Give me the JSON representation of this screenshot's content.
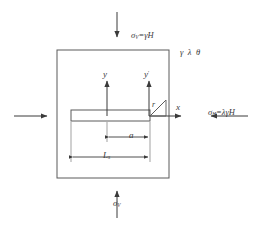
{
  "figure": {
    "type": "engineering-diagram",
    "background_color": "#ffffff",
    "line_color": "#3a3a3a",
    "text_color": "#3a3a3a"
  },
  "labels": {
    "sigma_v_top": "σ",
    "sigma_v_top_sub": "V",
    "sigma_v_top_rest": "=γH",
    "sigma_h_right": "σ",
    "sigma_h_right_sub": "H",
    "sigma_h_right_rest": "=λγH",
    "sigma_v_bottom": "σ",
    "sigma_v_bottom_sub": "V",
    "material_params": "γ λ θ",
    "axis_y": "y",
    "axis_y_prime": "y",
    "axis_y_prime_mark": "′",
    "axis_x": "x",
    "radius_r": "r",
    "crack_length_a": "a",
    "slot_length_L": "L",
    "slot_length_sub": "s"
  },
  "geometry": {
    "body_rect": {
      "x": 57,
      "y": 50,
      "w": 112,
      "h": 128
    },
    "crack_slot": {
      "x": 71,
      "y": 110,
      "w": 79,
      "h": 11
    },
    "y_axis": {
      "x": 107,
      "y_top": 79,
      "y_bottom": 116
    },
    "y_prime_axis": {
      "x": 149,
      "y_top": 79,
      "y_bottom": 116
    },
    "x_axis": {
      "y": 116,
      "x_start": 149,
      "x_end": 182
    },
    "wedge_triangle": {
      "apex_x": 150,
      "apex_y": 115,
      "top_x": 166,
      "top_y": 100,
      "base_x": 166,
      "base_y": 115
    },
    "dim_a": {
      "y": 137,
      "x_left": 107,
      "x_right": 150
    },
    "dim_Ls": {
      "y": 157,
      "x_left": 71,
      "x_right": 150
    }
  },
  "arrows": {
    "top_load": {
      "direction": "down",
      "x": 117,
      "y_start": 12,
      "y_end": 38,
      "labeled": true
    },
    "bottom_load": {
      "direction": "up",
      "x": 117,
      "y_start": 218,
      "y_end": 190,
      "labeled": true
    },
    "right_load": {
      "direction": "left",
      "y": 116,
      "x_start": 248,
      "x_end": 210,
      "labeled": true
    },
    "left_load": {
      "direction": "right",
      "y": 116,
      "x_start": 14,
      "x_end": 48,
      "labeled": false
    }
  }
}
